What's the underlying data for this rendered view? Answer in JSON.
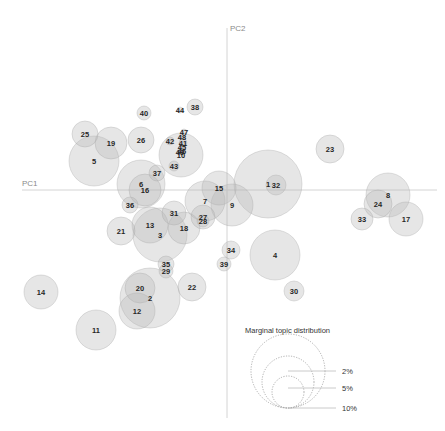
{
  "chart_data": {
    "type": "scatter",
    "subtype": "bubble",
    "title": "",
    "xlabel": "PC1",
    "ylabel": "PC2",
    "grid": false,
    "axes": {
      "x_axis_y_px": 190,
      "y_axis_x_px": 227
    },
    "legend": {
      "title": "Marginal topic distribution",
      "position": "bottom-right",
      "entries": [
        {
          "label": "2%",
          "r": 16
        },
        {
          "label": "5%",
          "r": 26
        },
        {
          "label": "10%",
          "r": 37
        }
      ]
    },
    "points": [
      {
        "id": "1",
        "x": 268,
        "y": 184,
        "r": 34
      },
      {
        "id": "32",
        "x": 276,
        "y": 185,
        "r": 10
      },
      {
        "id": "2",
        "x": 150,
        "y": 298,
        "r": 30
      },
      {
        "id": "3",
        "x": 160,
        "y": 235,
        "r": 27
      },
      {
        "id": "4",
        "x": 275,
        "y": 255,
        "r": 25
      },
      {
        "id": "5",
        "x": 94,
        "y": 161,
        "r": 25
      },
      {
        "id": "6",
        "x": 141,
        "y": 184,
        "r": 24
      },
      {
        "id": "16",
        "x": 145,
        "y": 190,
        "r": 16
      },
      {
        "id": "7",
        "x": 205,
        "y": 201,
        "r": 20
      },
      {
        "id": "8",
        "x": 388,
        "y": 195,
        "r": 22
      },
      {
        "id": "24",
        "x": 378,
        "y": 204,
        "r": 14
      },
      {
        "id": "9",
        "x": 232,
        "y": 205,
        "r": 21
      },
      {
        "id": "10",
        "x": 181,
        "y": 155,
        "r": 22
      },
      {
        "id": "11",
        "x": 96,
        "y": 330,
        "r": 20
      },
      {
        "id": "12",
        "x": 137,
        "y": 311,
        "r": 18
      },
      {
        "id": "13",
        "x": 150,
        "y": 225,
        "r": 18
      },
      {
        "id": "14",
        "x": 41,
        "y": 292,
        "r": 17
      },
      {
        "id": "15",
        "x": 219,
        "y": 188,
        "r": 17
      },
      {
        "id": "17",
        "x": 406,
        "y": 219,
        "r": 17
      },
      {
        "id": "18",
        "x": 184,
        "y": 228,
        "r": 16
      },
      {
        "id": "19",
        "x": 111,
        "y": 143,
        "r": 16
      },
      {
        "id": "20",
        "x": 140,
        "y": 288,
        "r": 15
      },
      {
        "id": "21",
        "x": 121,
        "y": 231,
        "r": 14
      },
      {
        "id": "22",
        "x": 192,
        "y": 287,
        "r": 14
      },
      {
        "id": "23",
        "x": 330,
        "y": 149,
        "r": 14
      },
      {
        "id": "25",
        "x": 85,
        "y": 134,
        "r": 13
      },
      {
        "id": "26",
        "x": 141,
        "y": 140,
        "r": 13
      },
      {
        "id": "27",
        "x": 203,
        "y": 217,
        "r": 12
      },
      {
        "id": "28",
        "x": 203,
        "y": 221,
        "r": 6
      },
      {
        "id": "29",
        "x": 166,
        "y": 271,
        "r": 7
      },
      {
        "id": "30",
        "x": 294,
        "y": 291,
        "r": 10
      },
      {
        "id": "31",
        "x": 174,
        "y": 213,
        "r": 12
      },
      {
        "id": "33",
        "x": 362,
        "y": 219,
        "r": 11
      },
      {
        "id": "34",
        "x": 231,
        "y": 250,
        "r": 9
      },
      {
        "id": "35",
        "x": 166,
        "y": 264,
        "r": 8
      },
      {
        "id": "36",
        "x": 130,
        "y": 205,
        "r": 8
      },
      {
        "id": "37",
        "x": 157,
        "y": 173,
        "r": 8
      },
      {
        "id": "38",
        "x": 195,
        "y": 107,
        "r": 8
      },
      {
        "id": "39",
        "x": 224,
        "y": 264,
        "r": 7
      },
      {
        "id": "40",
        "x": 144,
        "y": 113,
        "r": 7
      },
      {
        "id": "41",
        "x": 183,
        "y": 143,
        "r": 4
      },
      {
        "id": "42",
        "x": 170,
        "y": 141,
        "r": 4
      },
      {
        "id": "43",
        "x": 174,
        "y": 166,
        "r": 5
      },
      {
        "id": "44",
        "x": 180,
        "y": 110,
        "r": 3
      },
      {
        "id": "45",
        "x": 182,
        "y": 147,
        "r": 3
      },
      {
        "id": "46",
        "x": 182,
        "y": 151,
        "r": 3
      },
      {
        "id": "47",
        "x": 184,
        "y": 132,
        "r": 3
      },
      {
        "id": "48",
        "x": 182,
        "y": 137,
        "r": 3
      },
      {
        "id": "49",
        "x": 180,
        "y": 152,
        "r": 3
      }
    ]
  },
  "labels": {
    "pc1": "PC1",
    "pc2": "PC2",
    "legend_title": "Marginal topic distribution",
    "legend_2": "2%",
    "legend_5": "5%",
    "legend_10": "10%"
  }
}
